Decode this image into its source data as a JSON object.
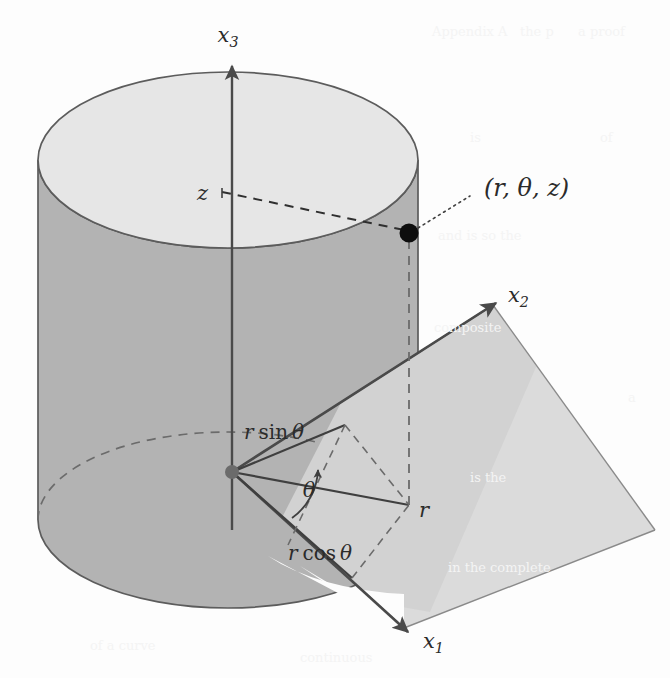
{
  "figure": {
    "colors": {
      "page_background": "#fdfdfd",
      "cylinder_top_face": "#e6e6e6",
      "cylinder_body": "#b3b3b3",
      "plane_fill": "#d9d9d9",
      "outline": "#5c5c5c",
      "axis": "#4a4a4a",
      "label_text": "#2b2b2b",
      "point_marker": "#0d0d0d",
      "origin_marker": "#6b6b6b"
    }
  },
  "axes": [
    {
      "id": "x3",
      "label": "x",
      "subscript": "3",
      "direction": "up"
    },
    {
      "id": "x2",
      "label": "x",
      "subscript": "2",
      "direction": "up-right"
    },
    {
      "id": "x1",
      "label": "x",
      "subscript": "1",
      "direction": "down-right"
    }
  ],
  "labels": {
    "point": "(r, θ, z)",
    "height": "z",
    "radius": "r",
    "angle": "θ",
    "sin_component": "r sin θ",
    "cos_component": "r cos θ",
    "sin_prefix": "r",
    "sin_function": "sin",
    "cos_prefix": "r",
    "cos_function": "cos",
    "theta_symbol": "θ"
  },
  "markers": [
    {
      "id": "point",
      "name": "cylindrical-point",
      "kind": "filled-dot",
      "color": "#0d0d0d"
    },
    {
      "id": "origin",
      "name": "origin",
      "kind": "filled-dot",
      "color": "#6b6b6b"
    }
  ],
  "bleed_text": [
    {
      "text": "Appendix A",
      "x": 432,
      "y": 24
    },
    {
      "text": "the p",
      "x": 520,
      "y": 24
    },
    {
      "text": "a proof",
      "x": 578,
      "y": 24
    },
    {
      "text": "is",
      "x": 470,
      "y": 130
    },
    {
      "text": "of",
      "x": 600,
      "y": 130
    },
    {
      "text": "and is so the",
      "x": 438,
      "y": 228
    },
    {
      "text": "composite",
      "x": 434,
      "y": 320
    },
    {
      "text": "a",
      "x": 628,
      "y": 390
    },
    {
      "text": "is the",
      "x": 470,
      "y": 470
    },
    {
      "text": "in the complete",
      "x": 448,
      "y": 560
    },
    {
      "text": "of a curve",
      "x": 90,
      "y": 638
    },
    {
      "text": "continuous",
      "x": 300,
      "y": 650
    }
  ]
}
